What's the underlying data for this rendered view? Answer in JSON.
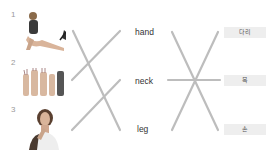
{
  "items": [
    {
      "number": "1",
      "image": "person-stretching-leg"
    },
    {
      "number": "2",
      "image": "raised-hands"
    },
    {
      "number": "3",
      "image": "person-touching-neck"
    }
  ],
  "english_words": [
    "hand",
    "neck",
    "leg"
  ],
  "korean_words": [
    "다리",
    "목",
    "손"
  ],
  "line_color": "#bdbdbd"
}
